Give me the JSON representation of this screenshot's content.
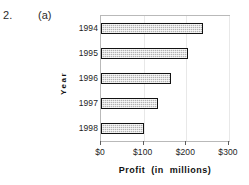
{
  "question": {
    "number": "2.",
    "part": "(a)"
  },
  "chart_data": {
    "type": "bar",
    "orientation": "horizontal",
    "title": "",
    "xlabel": "Profit   (in   millions)",
    "ylabel": "Year",
    "categories": [
      "1994",
      "1995",
      "1996",
      "1997",
      "1998"
    ],
    "values": [
      240,
      205,
      163,
      133,
      101
    ],
    "xlim": [
      0,
      300
    ],
    "xticks": [
      0,
      100,
      200,
      300
    ],
    "xtick_labels": [
      "$0",
      "$100",
      "$200",
      "$300"
    ],
    "grid": true,
    "legend": false,
    "series": [
      {
        "name": "Profit",
        "values": [
          240,
          205,
          163,
          133,
          101
        ],
        "bar_fill": "#b3b3b3",
        "bar_border": "#121212",
        "fill_pattern": "cross-hatch-dots"
      }
    ],
    "axis_label_parts": {
      "word1": "Profit",
      "word2": "(in",
      "word3": "millions)"
    }
  }
}
